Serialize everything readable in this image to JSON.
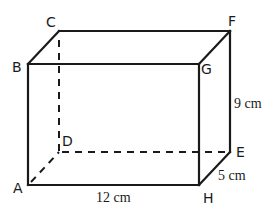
{
  "diagram": {
    "type": "rectangular-prism",
    "vertices": {
      "A": {
        "label": "A",
        "x": 28,
        "y": 185
      },
      "B": {
        "label": "B",
        "x": 28,
        "y": 64
      },
      "C": {
        "label": "C",
        "x": 59,
        "y": 31
      },
      "D": {
        "label": "D",
        "x": 59,
        "y": 152
      },
      "E": {
        "label": "E",
        "x": 230,
        "y": 152
      },
      "F": {
        "label": "F",
        "x": 230,
        "y": 31
      },
      "G": {
        "label": "G",
        "x": 199,
        "y": 64
      },
      "H": {
        "label": "H",
        "x": 199,
        "y": 185
      }
    },
    "solid_edges": [
      "AB",
      "BG",
      "GH",
      "HA",
      "BC",
      "CF",
      "GF",
      "FE",
      "HE"
    ],
    "hidden_edges": [
      "CD",
      "DE",
      "AD"
    ],
    "dimensions": {
      "length": "12 cm",
      "width": "5 cm",
      "height": "9 cm"
    },
    "colors": {
      "line": "#1a1a1a",
      "background": "#ffffff"
    }
  }
}
